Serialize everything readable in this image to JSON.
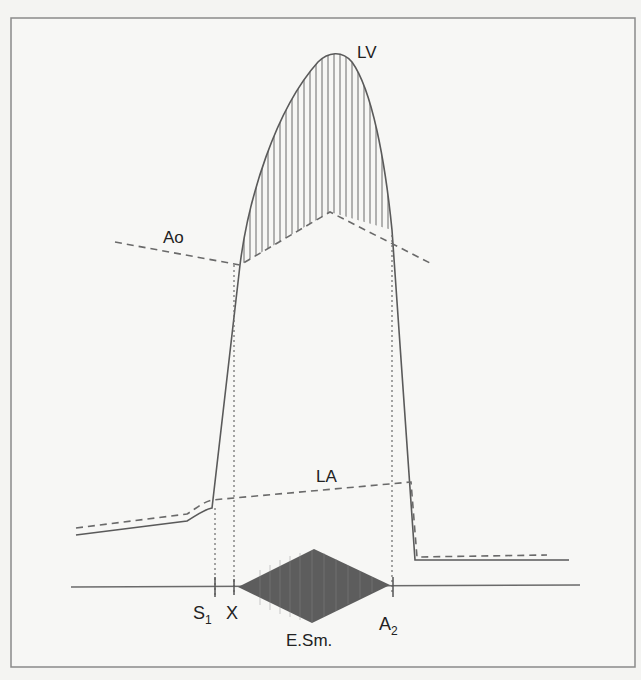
{
  "figure": {
    "type": "cardiac pressure / phonocardiogram diagram",
    "colors": {
      "page_bg": "#f4f4f2",
      "frame_bg": "#f7f7f5",
      "frame_border": "#8a8a8a",
      "line": "#5a5a5a",
      "murmur": "#555555",
      "text": "#222222"
    },
    "labels": {
      "lv": "LV",
      "ao": "Ao",
      "la": "LA",
      "s1": "S",
      "s1_sub": "1",
      "x": "X",
      "esm": "E.Sm.",
      "a2": "A",
      "a2_sub": "2"
    },
    "curves": {
      "lv": "left ventricular pressure (solid)",
      "ao": "aortic pressure (dashed)",
      "la": "left atrial pressure (dashed)",
      "gradient_hatch": "systolic pressure gradient between LV and Ao (vertical hatching)"
    },
    "timing_markers": [
      "S1",
      "X",
      "A2"
    ],
    "murmur": "ejection systolic murmur (diamond-shaped, crescendo-decrescendo)"
  }
}
